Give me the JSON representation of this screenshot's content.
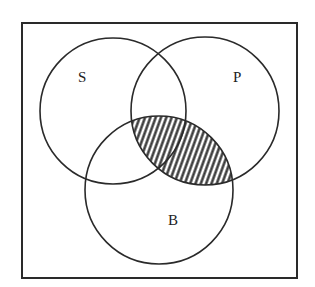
{
  "diagram": {
    "type": "venn",
    "universe_box": {
      "x": 22,
      "y": 23,
      "width": 275,
      "height": 255
    },
    "sets": [
      {
        "label": "S",
        "cx": 113,
        "cy": 111,
        "r": 73,
        "label_x": 78,
        "label_y": 82
      },
      {
        "label": "P",
        "cx": 205,
        "cy": 111,
        "r": 74,
        "label_x": 237,
        "label_y": 82
      },
      {
        "label": "B",
        "cx": 159,
        "cy": 190,
        "r": 74,
        "label_x": 173,
        "label_y": 225
      }
    ],
    "shaded_region": "P ∩ B",
    "stroke_color": "#2a2a2a",
    "shade_color": "#333333"
  }
}
